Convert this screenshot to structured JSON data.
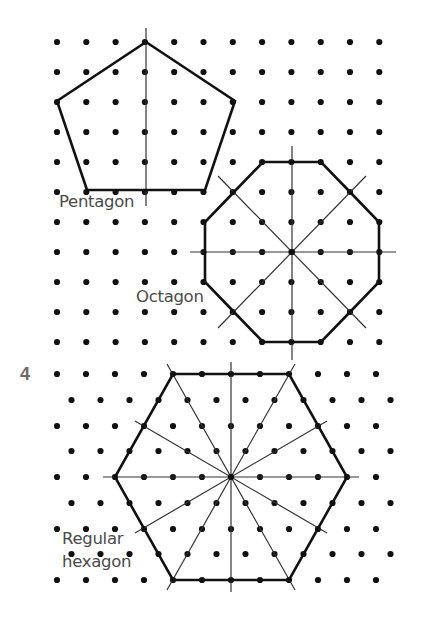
{
  "exercise_number": "4",
  "labels": {
    "pentagon": "Pentagon",
    "octagon": "Octagon",
    "hexagon_line1": "Regular",
    "hexagon_line2": "hexagon"
  },
  "colors": {
    "dot": "#111111",
    "shape_outline": "#111111",
    "axis_line": "#333333",
    "label_text": "#4a4a4a",
    "exercise_number": "#6b6b6b"
  },
  "square_grid": {
    "origin": [
      57,
      42
    ],
    "dx": 29.3,
    "dy": 30,
    "cols": 12,
    "rows": 11
  },
  "isometric_grid": {
    "rowA_x0": 57,
    "rowB_x0": 71.5,
    "dx": 29,
    "cols": 12,
    "rows_y": [
      374,
      400,
      426,
      451,
      477,
      503,
      529,
      554,
      580
    ]
  },
  "shapes": {
    "pentagon": {
      "vertices": [
        [
          146,
          42
        ],
        [
          235,
          101
        ],
        [
          205,
          190
        ],
        [
          87,
          190
        ],
        [
          57,
          101
        ]
      ],
      "symmetry_lines": [
        [
          [
            146,
            28
          ],
          [
            146,
            206
          ]
        ]
      ]
    },
    "octagon": {
      "center": [
        292,
        252
      ],
      "vertices": [
        [
          263,
          162
        ],
        [
          321,
          162
        ],
        [
          350,
          192
        ],
        [
          379,
          222
        ],
        [
          379,
          282
        ],
        [
          350,
          312
        ],
        [
          321,
          342
        ],
        [
          263,
          342
        ],
        [
          234,
          312
        ],
        [
          205,
          282
        ],
        [
          205,
          222
        ],
        [
          234,
          192
        ]
      ],
      "symmetry_lines": [
        [
          [
            292,
            146
          ],
          [
            292,
            360
          ]
        ],
        [
          [
            190,
            252
          ],
          [
            396,
            252
          ]
        ],
        [
          [
            218,
            176
          ],
          [
            366,
            328
          ]
        ],
        [
          [
            366,
            176
          ],
          [
            218,
            328
          ]
        ]
      ]
    },
    "hexagon": {
      "center": [
        231,
        477
      ],
      "vertices": [
        [
          173,
          374
        ],
        [
          289,
          374
        ],
        [
          347,
          477
        ],
        [
          289,
          580
        ],
        [
          173,
          580
        ],
        [
          115,
          477
        ]
      ],
      "symmetry_lines": [
        [
          [
            231,
            362
          ],
          [
            231,
            592
          ]
        ],
        [
          [
            103,
            477
          ],
          [
            359,
            477
          ]
        ],
        [
          [
            167,
            364
          ],
          [
            295,
            590
          ]
        ],
        [
          [
            295,
            364
          ],
          [
            167,
            590
          ]
        ],
        [
          [
            135,
            421
          ],
          [
            327,
            533
          ]
        ],
        [
          [
            327,
            421
          ],
          [
            135,
            533
          ]
        ]
      ]
    }
  }
}
